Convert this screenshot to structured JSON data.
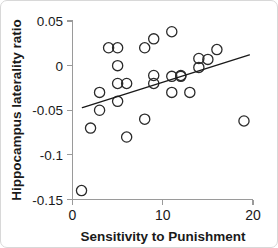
{
  "chart_data": {
    "type": "scatter",
    "title": "",
    "xlabel": "Sensitivity to Punishment",
    "ylabel": "Hippocampus laterality ratio",
    "xlim": [
      0,
      20
    ],
    "ylim": [
      -0.15,
      0.05
    ],
    "xticks": [
      0,
      10,
      20
    ],
    "xtick_labels": [
      "0",
      "10",
      "20"
    ],
    "yticks": [
      0.05,
      0,
      -0.05,
      -0.1,
      -0.15
    ],
    "ytick_labels": [
      "0.05",
      "0",
      "-0.05",
      "-0.1",
      "-0.15"
    ],
    "grid": false,
    "legend": false,
    "marker": "open-circle",
    "marker_color": "#2b2b2b",
    "points": [
      {
        "x": 1,
        "y": -0.14
      },
      {
        "x": 2,
        "y": -0.07
      },
      {
        "x": 3,
        "y": -0.03
      },
      {
        "x": 3,
        "y": -0.05
      },
      {
        "x": 4,
        "y": 0.02
      },
      {
        "x": 5,
        "y": 0.02
      },
      {
        "x": 5,
        "y": 0.0
      },
      {
        "x": 5,
        "y": -0.02
      },
      {
        "x": 5,
        "y": -0.04
      },
      {
        "x": 6,
        "y": -0.02
      },
      {
        "x": 6,
        "y": -0.08
      },
      {
        "x": 8,
        "y": -0.06
      },
      {
        "x": 8,
        "y": 0.02
      },
      {
        "x": 9,
        "y": 0.03
      },
      {
        "x": 9,
        "y": -0.011
      },
      {
        "x": 9,
        "y": -0.02
      },
      {
        "x": 11,
        "y": 0.038
      },
      {
        "x": 11,
        "y": -0.012
      },
      {
        "x": 11,
        "y": -0.03
      },
      {
        "x": 12,
        "y": -0.012
      },
      {
        "x": 12,
        "y": -0.011
      },
      {
        "x": 13,
        "y": -0.03
      },
      {
        "x": 14,
        "y": 0.008
      },
      {
        "x": 14,
        "y": -0.002
      },
      {
        "x": 15,
        "y": 0.007
      },
      {
        "x": 16,
        "y": 0.018
      },
      {
        "x": 19,
        "y": -0.062
      }
    ],
    "fit_line": {
      "x_start": 1.1,
      "y_start": -0.047,
      "x_end": 19.6,
      "y_end": 0.012,
      "color": "#1a1a1a"
    }
  }
}
